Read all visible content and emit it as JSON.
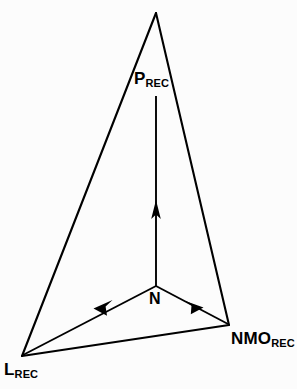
{
  "figure": {
    "type": "vector-diagram",
    "background_color": "#fcfcfc",
    "stroke_color": "#000000",
    "width": 297,
    "height": 389,
    "labels": {
      "apex": {
        "base": "P",
        "subscript": "REC",
        "full": "PREC"
      },
      "bottom_left": {
        "base": "L",
        "subscript": "REC",
        "full": "LREC"
      },
      "bottom_right": {
        "base": "NMO",
        "subscript": "REC",
        "full": "NMOREC"
      },
      "center_node": {
        "base": "N",
        "subscript": "",
        "full": "N"
      }
    },
    "geometry": {
      "triangle_vertices": [
        {
          "name": "apex",
          "x": 156,
          "y": 13
        },
        {
          "name": "bottom-left",
          "x": 22,
          "y": 356
        },
        {
          "name": "bottom-right",
          "x": 229,
          "y": 325
        }
      ],
      "center_node": {
        "x": 156,
        "y": 286
      },
      "arrows": [
        {
          "name": "n-to-p",
          "from": [
            156,
            286
          ],
          "to": [
            156,
            96
          ],
          "direction": "up"
        },
        {
          "name": "n-to-l",
          "from": [
            156,
            286
          ],
          "to": [
            23,
            355
          ],
          "direction": "down-left"
        },
        {
          "name": "n-to-nmo",
          "from": [
            156,
            286
          ],
          "to": [
            228,
            324
          ],
          "direction": "down-right"
        }
      ],
      "stroke_width": 2
    }
  }
}
